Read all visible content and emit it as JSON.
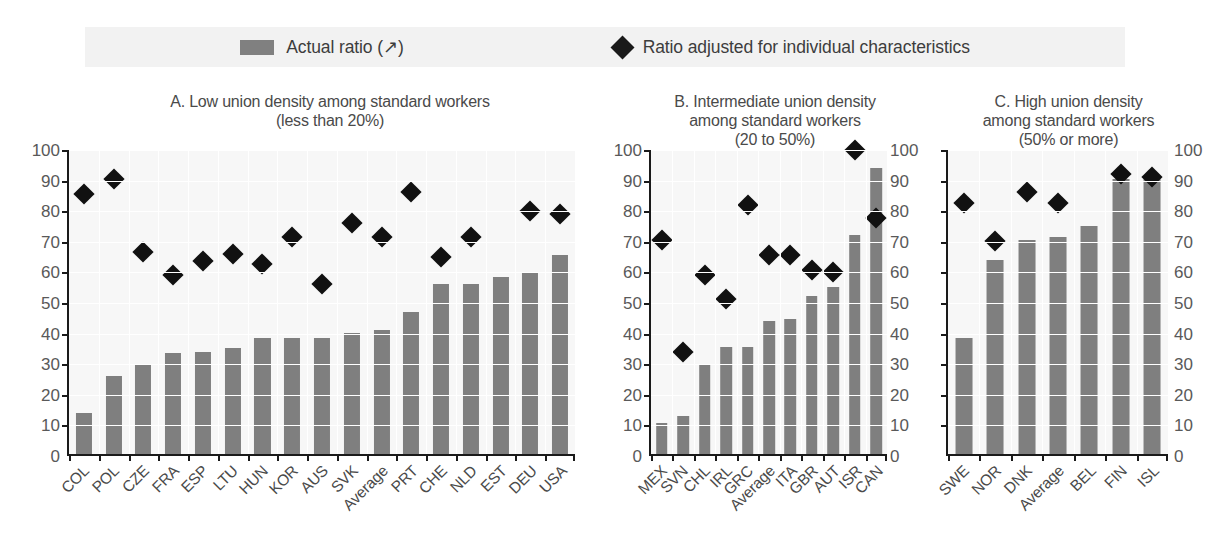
{
  "legend": {
    "items": [
      {
        "label": "Actual ratio (↗)",
        "marker": "bar-swatch-icon",
        "color": "#808080"
      },
      {
        "label": "Ratio adjusted for individual characteristics",
        "marker": "diamond-icon",
        "color": "#1a1a1a"
      }
    ]
  },
  "panels": {
    "a": {
      "title_line1": "A. Low union density among standard workers",
      "title_line2": "(less than 20%)"
    },
    "b": {
      "title_line1": "B. Intermediate union density",
      "title_line2": "among standard workers",
      "title_line3": "(20 to 50%)"
    },
    "c": {
      "title_line1": "C. High union density",
      "title_line2": "among standard workers",
      "title_line3": "(50% or more)"
    }
  },
  "axis": {
    "ticks": [
      100,
      90,
      80,
      70,
      60,
      50,
      40,
      30,
      20,
      10,
      0
    ],
    "min": 0,
    "max": 100
  },
  "chart_data": [
    {
      "type": "bar",
      "id": "panel-a",
      "title": "A. Low union density among standard workers (less than 20%)",
      "xlabel": "",
      "ylabel": "",
      "ylim": [
        0,
        100
      ],
      "grid": true,
      "legend_position": "top",
      "categories": [
        "COL",
        "POL",
        "CZE",
        "FRA",
        "ESP",
        "LTU",
        "HUN",
        "KOR",
        "AUS",
        "SVK",
        "Average",
        "PRT",
        "CHE",
        "NLD",
        "EST",
        "DEU",
        "USA"
      ],
      "series": [
        {
          "name": "Actual ratio (↗)",
          "type": "bar",
          "color": "#7f7f7f",
          "values": [
            13.5,
            25.5,
            29.5,
            33.0,
            33.5,
            34.5,
            38.0,
            38.0,
            38.0,
            39.5,
            40.5,
            46.5,
            55.5,
            55.5,
            58.0,
            59.5,
            65.0
          ]
        },
        {
          "name": "Ratio adjusted for individual characteristics",
          "type": "scatter",
          "color": "#111111",
          "values": [
            85.0,
            90.0,
            66.0,
            58.5,
            63.0,
            65.5,
            62.0,
            71.0,
            55.5,
            75.5,
            71.0,
            85.5,
            64.5,
            71.0,
            null,
            79.5,
            78.5
          ]
        }
      ]
    },
    {
      "type": "bar",
      "id": "panel-b",
      "title": "B. Intermediate union density among standard workers (20 to 50%)",
      "xlabel": "",
      "ylabel": "",
      "ylim": [
        0,
        100
      ],
      "grid": true,
      "legend_position": "top",
      "categories": [
        "MEX",
        "SVN",
        "CHL",
        "IRL",
        "GRC",
        "Average",
        "ITA",
        "GBR",
        "AUT",
        "ISR",
        "CAN"
      ],
      "series": [
        {
          "name": "Actual ratio (↗)",
          "type": "bar",
          "color": "#7f7f7f",
          "values": [
            10.0,
            12.5,
            29.0,
            35.0,
            35.0,
            43.5,
            44.0,
            51.5,
            54.5,
            71.5,
            93.5
          ]
        },
        {
          "name": "Ratio adjusted for individual characteristics",
          "type": "scatter",
          "color": "#111111",
          "values": [
            70.0,
            33.5,
            58.5,
            50.5,
            81.5,
            65.0,
            65.0,
            60.0,
            59.5,
            99.5,
            77.0
          ]
        }
      ]
    },
    {
      "type": "bar",
      "id": "panel-c",
      "title": "C. High union density among standard workers (50% or more)",
      "xlabel": "",
      "ylabel": "",
      "ylim": [
        0,
        100
      ],
      "grid": true,
      "legend_position": "top",
      "categories": [
        "SWE",
        "NOR",
        "DNK",
        "Average",
        "BEL",
        "FIN",
        "ISL"
      ],
      "series": [
        {
          "name": "Actual ratio (↗)",
          "type": "bar",
          "color": "#7f7f7f",
          "values": [
            38.0,
            63.5,
            70.0,
            71.0,
            74.5,
            90.0,
            90.5
          ]
        },
        {
          "name": "Ratio adjusted for individual characteristics",
          "type": "scatter",
          "color": "#111111",
          "values": [
            82.0,
            69.5,
            85.5,
            82.0,
            null,
            91.5,
            90.5
          ]
        }
      ]
    }
  ]
}
